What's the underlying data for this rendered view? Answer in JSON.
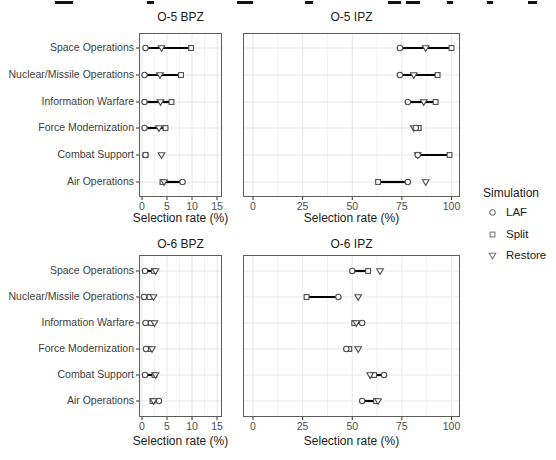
{
  "figure": {
    "cropped_top_caption": "partially visible text cut off at top edge",
    "xlabel": "Selection rate (%)",
    "categories": [
      "Space Operations",
      "Nuclear/Missile Operations",
      "Information Warfare",
      "Force Modernization",
      "Combat Support",
      "Air Operations"
    ],
    "legend": {
      "title": "Simulation",
      "items": [
        {
          "label": "LAF",
          "marker": "circle"
        },
        {
          "label": "Split",
          "marker": "square"
        },
        {
          "label": "Restore",
          "marker": "triangle-down"
        }
      ]
    },
    "colors": {
      "segment": "#000000",
      "marker_stroke": "#4d4d4d",
      "marker_fill": "#ffffff",
      "grid_major": "#e7e7e7",
      "grid_minor": "#f3f3f3",
      "panel_border": "#5c5c5c",
      "tick": "#333333",
      "tick_text": "#4d4d4d",
      "legend_marker_stroke": "#7a7a7a"
    }
  },
  "chart_data": [
    {
      "type": "scatter",
      "title": "O-5 BPZ",
      "xlabel": "Selection rate (%)",
      "xlim": [
        0,
        15
      ],
      "ticks": [
        0,
        5,
        10,
        15
      ],
      "grid": true,
      "segment_between": [
        "LAF",
        "Split"
      ],
      "categories": [
        "Space Operations",
        "Nuclear/Missile Operations",
        "Information Warfare",
        "Force Modernization",
        "Combat Support",
        "Air Operations"
      ],
      "series": [
        {
          "name": "LAF",
          "marker": "circle",
          "values": [
            0.7,
            0.5,
            0.5,
            0.5,
            0.7,
            8.1
          ]
        },
        {
          "name": "Split",
          "marker": "square",
          "values": [
            9.8,
            7.8,
            5.9,
            4.7,
            0.7,
            4.1
          ]
        },
        {
          "name": "Restore",
          "marker": "triangle-down",
          "values": [
            3.9,
            3.6,
            3.7,
            3.4,
            3.9,
            4.4
          ]
        }
      ]
    },
    {
      "type": "scatter",
      "title": "O-5 IPZ",
      "xlabel": "Selection rate (%)",
      "xlim": [
        0,
        100
      ],
      "ticks": [
        0,
        25,
        50,
        75,
        100
      ],
      "grid": true,
      "segment_between": [
        "LAF",
        "Split"
      ],
      "categories": [
        "Space Operations",
        "Nuclear/Missile Operations",
        "Information Warfare",
        "Force Modernization",
        "Combat Support",
        "Air Operations"
      ],
      "series": [
        {
          "name": "LAF",
          "marker": "circle",
          "values": [
            74,
            74,
            78,
            82,
            83,
            78
          ]
        },
        {
          "name": "Split",
          "marker": "square",
          "values": [
            100,
            93,
            92,
            83.5,
            99,
            63
          ]
        },
        {
          "name": "Restore",
          "marker": "triangle-down",
          "values": [
            87,
            81,
            86,
            81,
            83,
            87
          ]
        }
      ]
    },
    {
      "type": "scatter",
      "title": "O-6 BPZ",
      "xlabel": "Selection rate (%)",
      "xlim": [
        0,
        15
      ],
      "ticks": [
        0,
        5,
        10,
        15
      ],
      "grid": true,
      "segment_between": [
        "LAF",
        "Split"
      ],
      "categories": [
        "Space Operations",
        "Nuclear/Missile Operations",
        "Information Warfare",
        "Force Modernization",
        "Combat Support",
        "Air Operations"
      ],
      "series": [
        {
          "name": "LAF",
          "marker": "circle",
          "values": [
            0.6,
            0.4,
            0.7,
            0.8,
            0.6,
            3.4
          ]
        },
        {
          "name": "Split",
          "marker": "square",
          "values": [
            2.4,
            1.5,
            1.8,
            1.4,
            2.5,
            2.1
          ]
        },
        {
          "name": "Restore",
          "marker": "triangle-down",
          "values": [
            2.7,
            2.3,
            2.5,
            2.0,
            2.7,
            2.3
          ]
        }
      ]
    },
    {
      "type": "scatter",
      "title": "O-6 IPZ",
      "xlabel": "Selection rate (%)",
      "xlim": [
        0,
        100
      ],
      "ticks": [
        0,
        25,
        50,
        75,
        100
      ],
      "grid": true,
      "segment_between": [
        "LAF",
        "Split"
      ],
      "categories": [
        "Space Operations",
        "Nuclear/Missile Operations",
        "Information Warfare",
        "Force Modernization",
        "Combat Support",
        "Air Operations"
      ],
      "series": [
        {
          "name": "LAF",
          "marker": "circle",
          "values": [
            50,
            43,
            55,
            47,
            66,
            55
          ]
        },
        {
          "name": "Split",
          "marker": "square",
          "values": [
            58,
            27,
            51,
            48.5,
            61,
            62
          ]
        },
        {
          "name": "Restore",
          "marker": "triangle-down",
          "values": [
            64,
            53,
            52,
            53,
            59,
            63
          ]
        }
      ]
    }
  ]
}
